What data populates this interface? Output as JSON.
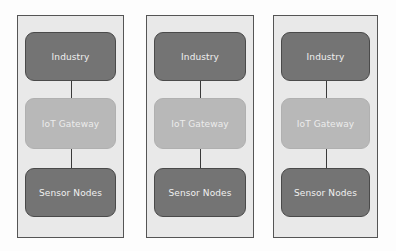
{
  "diagram": {
    "type": "layered-architecture",
    "panels": [
      {
        "layers": [
          {
            "label": "Industry",
            "style": "dark"
          },
          {
            "label": "IoT Gateway",
            "style": "light"
          },
          {
            "label": "Sensor Nodes",
            "style": "dark"
          }
        ]
      },
      {
        "layers": [
          {
            "label": "Industry",
            "style": "dark"
          },
          {
            "label": "IoT Gateway",
            "style": "light"
          },
          {
            "label": "Sensor Nodes",
            "style": "dark"
          }
        ]
      },
      {
        "layers": [
          {
            "label": "Industry",
            "style": "dark"
          },
          {
            "label": "IoT Gateway",
            "style": "light"
          },
          {
            "label": "Sensor Nodes",
            "style": "dark"
          }
        ]
      }
    ],
    "colors": {
      "panel_bg": "#e9e9e9",
      "panel_border": "#555555",
      "dark_node": "#747474",
      "light_node": "#b8b8b8",
      "text": "#f0f0f0",
      "connector": "#3a3a3a"
    }
  }
}
